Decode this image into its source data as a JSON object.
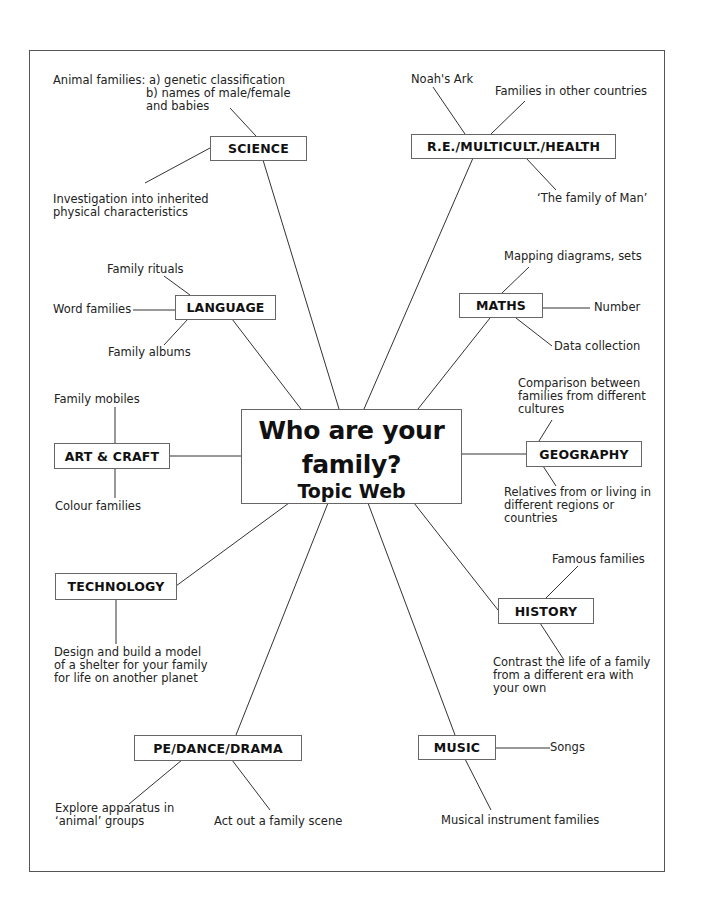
{
  "diagram": {
    "type": "topic-web",
    "center": {
      "title_line1": "Who are your",
      "title_line2": "family?",
      "subtitle": "Topic Web"
    },
    "subjects": {
      "science": {
        "label": "SCIENCE",
        "notes": [
          "Animal families: a) genetic classification",
          "b) names of male/female",
          "and babies",
          "Investigation into inherited",
          "physical characteristics"
        ]
      },
      "re": {
        "label": "R.E./MULTICULT./HEALTH",
        "notes": [
          "Noah's Ark",
          "Families in other countries",
          "‘The family of Man’"
        ]
      },
      "language": {
        "label": "LANGUAGE",
        "notes": [
          "Family rituals",
          "Word families",
          "Family albums"
        ]
      },
      "maths": {
        "label": "MATHS",
        "notes": [
          "Mapping diagrams, sets",
          "Number",
          "Data collection"
        ]
      },
      "art": {
        "label": "ART & CRAFT",
        "notes": [
          "Family mobiles",
          "Colour families"
        ]
      },
      "geography": {
        "label": "GEOGRAPHY",
        "notes": [
          "Comparison between",
          "families from different",
          "cultures",
          "Relatives from or living in",
          "different regions or",
          "countries"
        ]
      },
      "technology": {
        "label": "TECHNOLOGY",
        "notes": [
          "Design and build a model",
          "of a shelter for your family",
          "for life on another planet"
        ]
      },
      "history": {
        "label": "HISTORY",
        "notes": [
          "Famous families",
          "Contrast the life of a family",
          "from a different era with",
          "your own"
        ]
      },
      "pe": {
        "label": "PE/DANCE/DRAMA",
        "notes": [
          "Explore apparatus in",
          "‘animal’ groups",
          "Act out a family scene"
        ]
      },
      "music": {
        "label": "MUSIC",
        "notes": [
          "Songs",
          "Musical instrument families"
        ]
      }
    },
    "colors": {
      "line": "#333333",
      "box_border": "#666666",
      "text": "#111111",
      "frame": "#555555"
    }
  }
}
